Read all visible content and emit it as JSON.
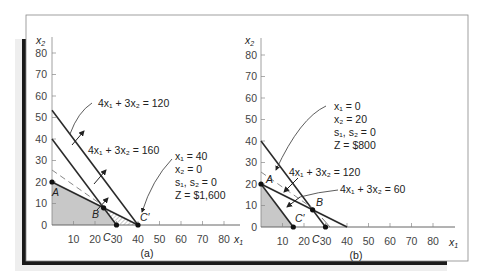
{
  "figure": {
    "panels": [
      {
        "id": "a",
        "caption": "(a)",
        "x_axis_label": "x",
        "x_axis_sub": "1",
        "y_axis_label": "x",
        "y_axis_sub": "2",
        "x_ticks": [
          "10",
          "20",
          "30",
          "40",
          "50",
          "60",
          "70",
          "80"
        ],
        "y_ticks": [
          "0",
          "10",
          "20",
          "30",
          "40",
          "50",
          "60",
          "70",
          "80"
        ],
        "constraint_line_1": "4x₁ + 3x₂ = 120",
        "constraint_line_2": "4x₁ + 3x₂ = 160",
        "points": {
          "A": "A",
          "B": "B",
          "C": "C",
          "C_prime": "C′"
        },
        "solution": {
          "x1": "x₁  = 40",
          "x2": "x₂  = 0",
          "slacks": "s₁, s₂ = 0",
          "z": "Z  = $1,600"
        }
      },
      {
        "id": "b",
        "caption": "(b)",
        "x_axis_label": "x",
        "x_axis_sub": "1",
        "y_axis_label": "x",
        "y_axis_sub": "2",
        "x_ticks": [
          "10",
          "20",
          "30",
          "40",
          "50",
          "60",
          "70",
          "80"
        ],
        "y_ticks": [
          "0",
          "10",
          "20",
          "30",
          "40",
          "50",
          "60",
          "70",
          "80"
        ],
        "constraint_line_1": "4x₁ + 3x₂ = 120",
        "constraint_line_2": "4x₁ + 3x₂ = 60",
        "points": {
          "A": "A",
          "B": "B",
          "C": "C",
          "C_prime": "C′"
        },
        "solution": {
          "x1": "x₁  = 0",
          "x2": "x₂  = 20",
          "slacks": "s₁, s₂ = 0",
          "z": "Z  = $800"
        }
      }
    ],
    "colors": {
      "line": "#2a2a2a",
      "feasible_fill": "#c8c8c8",
      "axis": "#666666",
      "frame_shadow": "#1a1a1a"
    }
  }
}
